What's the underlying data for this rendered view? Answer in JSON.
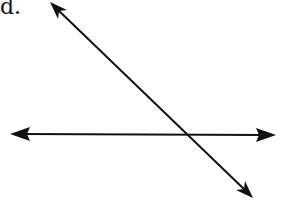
{
  "figure": {
    "label": "d.",
    "lines": [
      {
        "name": "horizontal-line",
        "x1": 10,
        "y1": 134,
        "x2": 276,
        "y2": 135
      },
      {
        "name": "diagonal-line",
        "x1": 50,
        "y1": 2,
        "x2": 253,
        "y2": 198
      }
    ],
    "intersection": {
      "x": 184,
      "y": 134
    },
    "stroke_color": "#111111"
  }
}
